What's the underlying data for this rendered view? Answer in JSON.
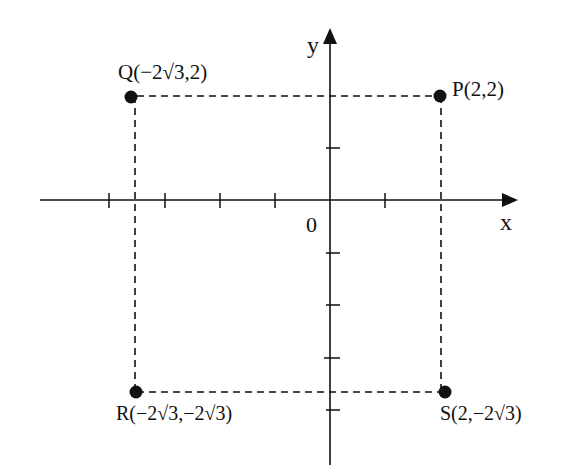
{
  "diagram": {
    "type": "coordinate-plane",
    "axes": {
      "x_label": "x",
      "y_label": "y",
      "origin_label": "0"
    },
    "points": [
      {
        "name": "P",
        "label": "P(2,2)",
        "coords": [
          "2",
          "2"
        ]
      },
      {
        "name": "Q",
        "label": "Q(−2√3,2)",
        "coords": [
          "−2√3",
          "2"
        ]
      },
      {
        "name": "R",
        "label": "R(−2√3,−2√3)",
        "coords": [
          "−2√3",
          "−2√3"
        ]
      },
      {
        "name": "S",
        "label": "S(2,−2√3)",
        "coords": [
          "2",
          "−2√3"
        ]
      }
    ],
    "rectangle": "PQRS drawn with dashed lines",
    "colors": {
      "ink": "#111111",
      "background": "#ffffff"
    }
  }
}
